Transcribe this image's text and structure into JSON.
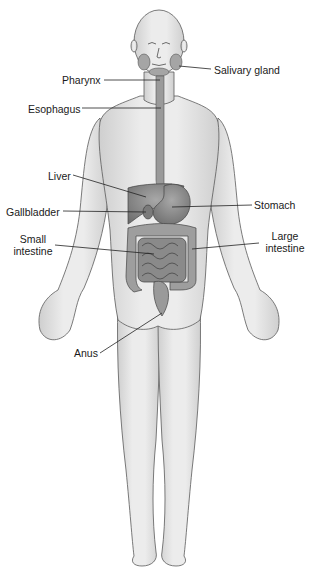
{
  "diagram": {
    "labels": {
      "salivary_gland": "Salivary gland",
      "pharynx": "Pharynx",
      "esophagus": "Esophagus",
      "liver": "Liver",
      "gallbladder": "Gallbladder",
      "stomach": "Stomach",
      "small_intestine_1": "Small",
      "small_intestine_2": "intestine",
      "large_intestine_1": "Large",
      "large_intestine_2": "intestine",
      "anus": "Anus"
    },
    "colors": {
      "skin": "#e6e6e6",
      "outline": "#5a5a5a",
      "organ": "#8c8c8c",
      "leader_line": "#222222"
    }
  }
}
